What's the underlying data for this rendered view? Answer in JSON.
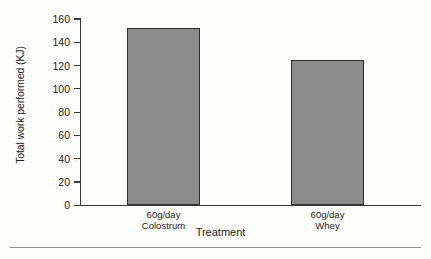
{
  "chart_data": {
    "type": "bar",
    "title": "",
    "subtitle": "",
    "xlabel": "Treatment",
    "ylabel": "Total work performed (KJ)",
    "categories": [
      "60g/day\nColostrum",
      "60g/day\nWhey"
    ],
    "category_lines": [
      [
        "60g/day",
        "Colostrum"
      ],
      [
        "60g/day",
        "Whey"
      ]
    ],
    "values": [
      152,
      125
    ],
    "ylim": [
      0,
      160
    ],
    "ytick_labels": [
      "0",
      "20",
      "40",
      "60",
      "80",
      "100",
      "120",
      "140",
      "160"
    ],
    "yticks": [
      0,
      20,
      40,
      60,
      80,
      100,
      120,
      140,
      160
    ],
    "grid": false,
    "legend": "none",
    "bar_fill_color": "#8b8b8b",
    "bar_edge_color": "#2e2e2e",
    "axis_color": "#3a3a3a",
    "text_color": "#1c1c1c",
    "background_color": "#fdfdfc"
  },
  "figure": {
    "bottom_rule": ""
  }
}
